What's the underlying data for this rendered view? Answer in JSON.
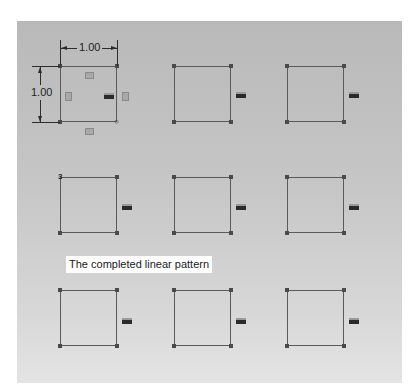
{
  "caption": "The completed linear pattern",
  "dimensions": {
    "horizontal": "1.00",
    "vertical": "1.00"
  },
  "pattern": {
    "rows": 3,
    "columns": 3,
    "instances": [
      {
        "row": 1,
        "col": 1,
        "label": "seed-sketch"
      },
      {
        "row": 1,
        "col": 2
      },
      {
        "row": 1,
        "col": 3
      },
      {
        "row": 2,
        "col": 1
      },
      {
        "row": 2,
        "col": 2
      },
      {
        "row": 2,
        "col": 3
      },
      {
        "row": 3,
        "col": 1
      },
      {
        "row": 3,
        "col": 2
      },
      {
        "row": 3,
        "col": 3
      }
    ]
  },
  "icons": {
    "relation": "equal-relation-icon",
    "constraint": "horizontal-vertical-constraint-icon",
    "origin": "origin-point-icon"
  },
  "colors": {
    "canvas_top": "#b9b9b9",
    "canvas_bottom": "#e4e4e4",
    "sketch_line": "#5a5a5a",
    "caption_bg": "#ffffff"
  }
}
